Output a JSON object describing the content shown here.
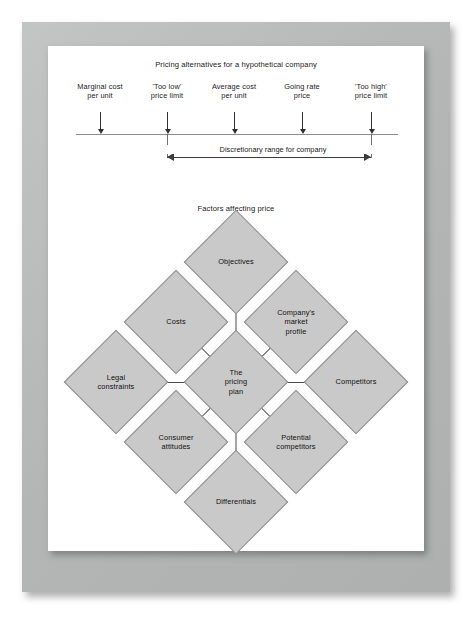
{
  "page": {
    "frame_color": "#b9bbbb",
    "sheet_color": "#ffffff"
  },
  "scale_figure": {
    "title": "Pricing alternatives for a hypothetical company",
    "ticks": [
      {
        "label": "Marginal cost\nper unit",
        "x": 52
      },
      {
        "label": "'Too low'\nprice limit",
        "x": 119
      },
      {
        "label": "Average cost\nper unit",
        "x": 186
      },
      {
        "label": "Going rate\nprice",
        "x": 254
      },
      {
        "label": "'Too high'\nprice limit",
        "x": 323
      }
    ],
    "range": {
      "label": "Discretionary range for company",
      "from_tick": 1,
      "to_tick": 4
    }
  },
  "diamond_figure": {
    "title": "Factors affecting price",
    "center_label": "The\npricing\nplan",
    "nodes": [
      {
        "id": "objectives",
        "label": "Objectives",
        "cx": 188,
        "cy": 66
      },
      {
        "id": "costs",
        "label": "Costs",
        "cx": 128,
        "cy": 126
      },
      {
        "id": "company-profile",
        "label": "Company's\nmarket\nprofile",
        "cx": 248,
        "cy": 126
      },
      {
        "id": "legal-constraints",
        "label": "Legal\nconstraints",
        "cx": 68,
        "cy": 186
      },
      {
        "id": "pricing-plan",
        "label": "The\npricing\nplan",
        "cx": 188,
        "cy": 186
      },
      {
        "id": "competitors",
        "label": "Competitors",
        "cx": 308,
        "cy": 186
      },
      {
        "id": "consumer-attitudes",
        "label": "Consumer\nattitudes",
        "cx": 128,
        "cy": 246
      },
      {
        "id": "potential-competitors",
        "label": "Potential\ncompetitors",
        "cx": 248,
        "cy": 246
      },
      {
        "id": "differentials",
        "label": "Differentials",
        "cx": 188,
        "cy": 306
      }
    ],
    "arrows": [
      {
        "from": "objectives",
        "to": "pricing-plan"
      },
      {
        "from": "costs",
        "to": "pricing-plan"
      },
      {
        "from": "company-profile",
        "to": "pricing-plan"
      },
      {
        "from": "legal-constraints",
        "to": "pricing-plan"
      },
      {
        "from": "competitors",
        "to": "pricing-plan"
      },
      {
        "from": "consumer-attitudes",
        "to": "pricing-plan"
      },
      {
        "from": "potential-competitors",
        "to": "pricing-plan"
      },
      {
        "from": "differentials",
        "to": "pricing-plan"
      }
    ]
  }
}
